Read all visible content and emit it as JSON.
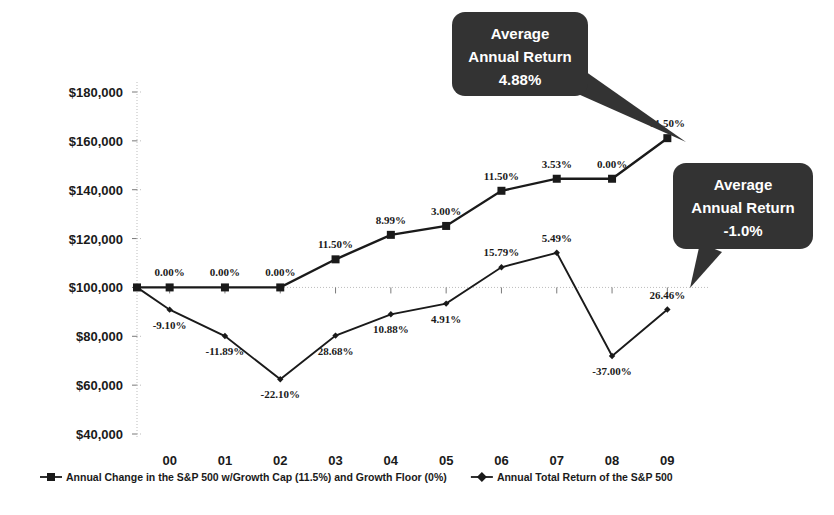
{
  "chart_data": {
    "type": "line",
    "title": "",
    "subtitle": "",
    "xlabel": "",
    "ylabel": "",
    "grid": true,
    "legend_position": "bottom",
    "categories": [
      "00",
      "01",
      "02",
      "03",
      "04",
      "05",
      "06",
      "07",
      "08",
      "09"
    ],
    "ylim": [
      40000,
      180000
    ],
    "ytick_labels": [
      "$180,000",
      "$160,000",
      "$140,000",
      "$120,000",
      "$100,000",
      "$80,000",
      "$60,000",
      "$40,000"
    ],
    "ytick_values": [
      180000,
      160000,
      140000,
      120000,
      100000,
      80000,
      60000,
      40000
    ],
    "start_value": 100000,
    "series": [
      {
        "name": "Annual Change in the S&P 500 w/Growth Cap (11.5%) and Growth Floor (0%)",
        "marker": "square",
        "values": [
          100000,
          100000,
          100000,
          111500,
          121523,
          125169,
          139563,
          144489,
          144489,
          161105
        ],
        "point_labels": [
          "0.00%",
          "0.00%",
          "0.00%",
          "11.50%",
          "8.99%",
          "3.00%",
          "11.50%",
          "3.53%",
          "0.00%",
          "11.50%"
        ],
        "label_positions": [
          "above",
          "above",
          "above",
          "above",
          "above",
          "above",
          "above",
          "above",
          "above",
          "above"
        ]
      },
      {
        "name": "Annual Total Return of the S&P 500",
        "marker": "diamond",
        "values": [
          90900,
          80090,
          62390,
          80282,
          89017,
          93388,
          108233,
          114175,
          71930,
          90960
        ],
        "point_labels": [
          "-9.10%",
          "-11.89%",
          "-22.10%",
          "28.68%",
          "10.88%",
          "4.91%",
          "15.79%",
          "5.49%",
          "-37.00%",
          "26.46%"
        ],
        "label_positions": [
          "below",
          "below",
          "below",
          "below",
          "below",
          "below",
          "above",
          "above",
          "below",
          "above"
        ]
      }
    ],
    "annotations": [
      {
        "id": "callout-capped",
        "lines": [
          "Average",
          "Annual Return",
          "4.88%"
        ],
        "target_series": 0,
        "target_index": 9,
        "tail_direction": "down-right"
      },
      {
        "id": "callout-sp500",
        "lines": [
          "Average",
          "Annual Return",
          "-1.0%"
        ],
        "target_series": 1,
        "target_index": 9,
        "tail_direction": "down-left"
      }
    ],
    "colors": {
      "series_line": "#1a1a1a",
      "callout_fill": "#333333",
      "callout_text": "#ffffff",
      "grid": "#bdbdbd",
      "axis": "#9a9a9a",
      "text": "#1a1a1a",
      "background": "#ffffff"
    }
  },
  "legend": {
    "items": [
      {
        "label": "Annual Change in the S&P 500 w/Growth Cap (11.5%) and Growth Floor (0%)",
        "marker": "square"
      },
      {
        "label": "Annual Total Return of the S&P 500",
        "marker": "diamond"
      }
    ]
  }
}
